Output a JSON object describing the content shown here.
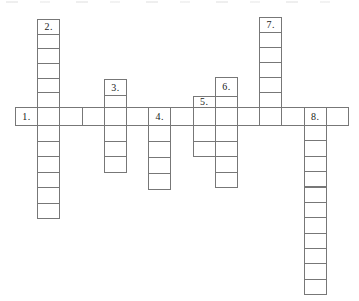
{
  "canvas": {
    "width": 359,
    "height": 301,
    "background": "#ffffff",
    "grid_line_color": "#777777",
    "cell_fill": "#ffffff",
    "clue_number_color": "#1a1a1a"
  },
  "puzzle": {
    "type": "crossword-grid",
    "clue_numbers": [
      "1.",
      "2.",
      "3.",
      "4.",
      "5.",
      "6.",
      "7.",
      "8."
    ],
    "across": {
      "y": 107,
      "height": 18,
      "cell_width": 22.2,
      "cells": [
        {
          "x": 15.0,
          "label": "1."
        },
        {
          "x": 37.2
        },
        {
          "x": 59.4
        },
        {
          "x": 81.6
        },
        {
          "x": 103.8
        },
        {
          "x": 126.0
        },
        {
          "x": 148.2,
          "label": "4."
        },
        {
          "x": 170.4
        },
        {
          "x": 192.6
        },
        {
          "x": 214.8
        },
        {
          "x": 237.0
        },
        {
          "x": 259.2
        },
        {
          "x": 281.4
        },
        {
          "x": 303.6,
          "label": "8."
        },
        {
          "x": 325.8
        }
      ]
    },
    "down_words": [
      {
        "name": "word-2",
        "x": 37.2,
        "width": 22.2,
        "cells": [
          {
            "y": 19.0,
            "h": 14.7,
            "label": "2."
          },
          {
            "y": 33.7,
            "h": 14.6
          },
          {
            "y": 48.3,
            "h": 14.7
          },
          {
            "y": 63.0,
            "h": 14.7
          },
          {
            "y": 77.7,
            "h": 14.6
          },
          {
            "y": 92.3,
            "h": 14.7
          },
          {
            "y": 125.0,
            "h": 15.5
          },
          {
            "y": 140.5,
            "h": 15.5
          },
          {
            "y": 156.0,
            "h": 15.5
          },
          {
            "y": 171.5,
            "h": 15.5
          },
          {
            "y": 187.0,
            "h": 15.5
          },
          {
            "y": 202.5,
            "h": 15.5
          }
        ]
      },
      {
        "name": "word-3",
        "x": 103.8,
        "width": 22.2,
        "cells": [
          {
            "y": 79.3,
            "h": 15.7,
            "label": "3."
          },
          {
            "y": 95.0,
            "h": 12.0
          },
          {
            "y": 125.0,
            "h": 15.7
          },
          {
            "y": 140.7,
            "h": 15.6
          },
          {
            "y": 156.3,
            "h": 15.7
          }
        ]
      },
      {
        "name": "word-4",
        "x": 148.2,
        "width": 22.2,
        "cells": [
          {
            "y": 125.0,
            "h": 16.0
          },
          {
            "y": 141.0,
            "h": 16.0
          },
          {
            "y": 157.0,
            "h": 16.0
          },
          {
            "y": 173.0,
            "h": 16.0
          }
        ]
      },
      {
        "name": "word-5",
        "x": 192.6,
        "width": 22.2,
        "cells": [
          {
            "y": 95.7,
            "h": 11.3,
            "label": "5."
          },
          {
            "y": 125.0,
            "h": 15.7
          },
          {
            "y": 140.7,
            "h": 15.3
          }
        ]
      },
      {
        "name": "word-6",
        "x": 214.8,
        "width": 22.2,
        "cells": [
          {
            "y": 77.3,
            "h": 18.4,
            "label": "6."
          },
          {
            "y": 95.7,
            "h": 11.3
          },
          {
            "y": 125.0,
            "h": 15.7
          },
          {
            "y": 140.7,
            "h": 15.3
          },
          {
            "y": 156.0,
            "h": 15.7
          },
          {
            "y": 171.7,
            "h": 15.3
          }
        ]
      },
      {
        "name": "word-7",
        "x": 259.2,
        "width": 22.2,
        "cells": [
          {
            "y": 16.7,
            "h": 15.1,
            "label": "7."
          },
          {
            "y": 31.8,
            "h": 15.1
          },
          {
            "y": 46.9,
            "h": 15.1
          },
          {
            "y": 62.0,
            "h": 15.1
          },
          {
            "y": 77.1,
            "h": 15.1
          },
          {
            "y": 92.2,
            "h": 14.8
          }
        ]
      },
      {
        "name": "word-8",
        "x": 303.6,
        "width": 22.2,
        "cells": [
          {
            "y": 125.0,
            "h": 15.4
          },
          {
            "y": 140.4,
            "h": 15.4
          },
          {
            "y": 155.8,
            "h": 15.4
          },
          {
            "y": 171.2,
            "h": 15.3
          },
          {
            "y": 186.5,
            "h": 15.4
          },
          {
            "y": 201.9,
            "h": 15.4
          },
          {
            "y": 217.3,
            "h": 15.3
          },
          {
            "y": 232.6,
            "h": 15.4
          },
          {
            "y": 248.0,
            "h": 15.4
          },
          {
            "y": 263.4,
            "h": 15.4
          },
          {
            "y": 278.8,
            "h": 15.4
          }
        ]
      }
    ]
  }
}
